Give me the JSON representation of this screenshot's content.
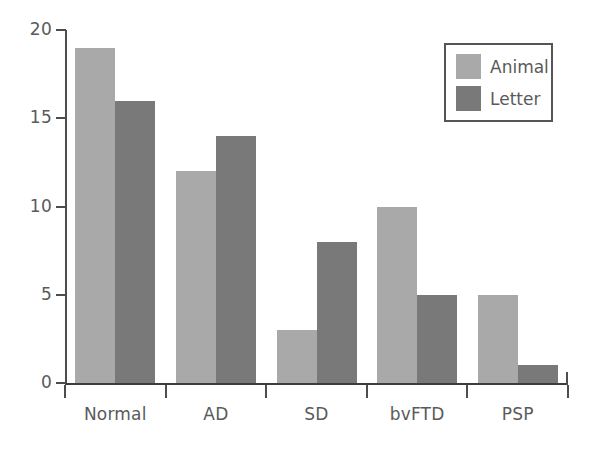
{
  "chart_data": {
    "type": "bar",
    "title": "",
    "xlabel": "",
    "ylabel": "",
    "ylim": [
      0,
      20
    ],
    "yticks": [
      0,
      5,
      10,
      15,
      20
    ],
    "ytick_labels": [
      "0",
      "5",
      "10",
      "15",
      "20"
    ],
    "grid": false,
    "legend_position": "top-right",
    "categories": [
      "Normal",
      "AD",
      "SD",
      "bvFTD",
      "PSP"
    ],
    "series": [
      {
        "name": "Animal",
        "color": "#a9a9a9",
        "values": [
          19,
          12,
          3,
          10,
          5
        ]
      },
      {
        "name": "Letter",
        "color": "#797979",
        "values": [
          16,
          14,
          8,
          5,
          1
        ]
      }
    ]
  },
  "legend": {
    "entries": [
      {
        "label": "Animal",
        "swatch": "animal"
      },
      {
        "label": "Letter",
        "swatch": "letter"
      }
    ]
  },
  "colors": {
    "animal": "#a9a9a9",
    "letter": "#797979",
    "axis": "#4d4d4d",
    "text": "#5a5a5a",
    "background": "#ffffff"
  }
}
